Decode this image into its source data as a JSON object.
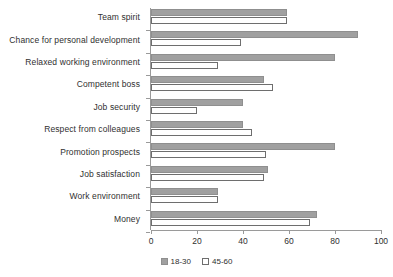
{
  "chart_data": {
    "type": "bar",
    "orientation": "horizontal",
    "title": "",
    "subtitle": "",
    "xlabel": "",
    "ylabel": "",
    "xlim": [
      0,
      100
    ],
    "xticks": [
      0,
      20,
      40,
      60,
      80,
      100
    ],
    "grid": false,
    "legend_position": "bottom-center",
    "categories": [
      "Team spirit",
      "Chance for personal development",
      "Relaxed working environment",
      "Competent boss",
      "Job security",
      "Respect from colleagues",
      "Promotion prospects",
      "Job satisfaction",
      "Work environment",
      "Money"
    ],
    "series": [
      {
        "name": "18-30",
        "color": "#a0a0a0",
        "values": [
          59,
          90,
          80,
          49,
          40,
          40,
          80,
          51,
          29,
          72
        ]
      },
      {
        "name": "45-60",
        "color": "#ffffff",
        "values": [
          59,
          39,
          29,
          53,
          20,
          44,
          50,
          49,
          29,
          69
        ]
      }
    ]
  },
  "legend": {
    "items": [
      {
        "label": "18-30"
      },
      {
        "label": "45-60"
      }
    ]
  },
  "axis": {
    "tick_labels": [
      "0",
      "20",
      "40",
      "60",
      "80",
      "100"
    ]
  },
  "colors": {
    "series_a_fill": "#a0a0a0",
    "series_a_stroke": "#8f8f8f",
    "series_b_fill": "#ffffff",
    "series_b_stroke": "#6e6e6e",
    "axis": "#9a9a9a",
    "text": "#2f2f2f",
    "background": "#ffffff"
  }
}
